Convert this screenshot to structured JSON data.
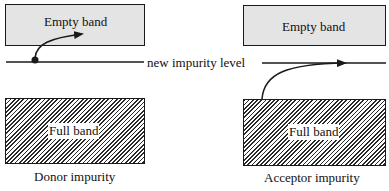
{
  "diagram": {
    "donor": {
      "empty_band_label": "Empty band",
      "full_band_label": "Full band",
      "caption": "Donor impurity"
    },
    "acceptor": {
      "empty_band_label": "Empty band",
      "full_band_label": "Full band",
      "caption": "Acceptor impurity"
    },
    "impurity_level_label": "new impurity level",
    "colors": {
      "empty_band_fill": "#e4e4e4",
      "line": "#1a1a1a",
      "hatch": "#2a2a2a"
    }
  }
}
